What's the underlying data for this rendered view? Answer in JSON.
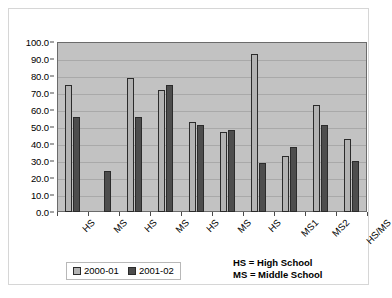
{
  "chart_data": {
    "type": "bar",
    "title": "",
    "xlabel": "",
    "ylabel": "",
    "ylim": [
      0,
      100
    ],
    "ytick_step": 10,
    "grid": true,
    "legend_position": "bottom-left",
    "categories": [
      "HS",
      "MS",
      "HS",
      "MS",
      "HS",
      "MS",
      "HS",
      "MS1",
      "MS2",
      "HS/MS"
    ],
    "series": [
      {
        "name": "2000-01",
        "color": "#b3b3b3",
        "values": [
          75,
          0,
          79,
          72,
          53,
          47,
          93,
          33,
          63,
          43
        ]
      },
      {
        "name": "2001-02",
        "color": "#4d4d4d",
        "values": [
          56,
          24,
          56,
          75,
          51,
          48,
          29,
          38,
          51,
          30
        ]
      }
    ],
    "ytick_labels": [
      "0.0",
      "10.0",
      "20.0",
      "30.0",
      "40.0",
      "50.0",
      "60.0",
      "70.0",
      "80.0",
      "90.0",
      "100.0"
    ],
    "annotations": [
      "HS = High School",
      "MS = Middle School"
    ],
    "plot_background": "#c2c2c2",
    "gridline_color": "#a9a9a9",
    "axis_color": "#6b6b6b"
  }
}
